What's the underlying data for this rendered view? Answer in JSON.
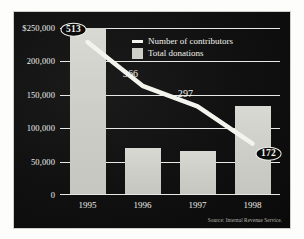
{
  "chart_data": {
    "type": "bar",
    "title": "",
    "subtitle": "",
    "xlabel": "",
    "ylabel": "",
    "categories": [
      "1995",
      "1996",
      "1997",
      "1998"
    ],
    "ylim": [
      0,
      250000
    ],
    "yticks": [
      0,
      50000,
      100000,
      150000,
      200000,
      250000
    ],
    "ytick_labels": [
      "0",
      "50,000",
      "100,000",
      "150,000",
      "200,000",
      "$250,000"
    ],
    "grid": true,
    "legend_position": "top-center",
    "series": [
      {
        "name": "Total donations",
        "type": "bar",
        "values": [
          250000,
          71000,
          66000,
          133000
        ],
        "color": "#cfcfc9",
        "axis": "left"
      },
      {
        "name": "Number of contributors",
        "type": "line",
        "values": [
          513,
          366,
          297,
          172
        ],
        "color": "#f4f4ef",
        "axis": "right",
        "point_labels": [
          "513",
          "366",
          "297",
          "172"
        ],
        "label_styles": [
          "oval",
          "plain",
          "plain",
          "oval"
        ]
      }
    ],
    "source": "Source: Internal Revenue Service."
  },
  "legend": {
    "items": [
      {
        "label": "Number of contributors",
        "key": "line"
      },
      {
        "label": "Total donations",
        "key": "swatch"
      }
    ]
  },
  "axis": {
    "y_labels": [
      "$250,000",
      "200,000",
      "150,000",
      "100,000",
      "50,000",
      "0"
    ],
    "x_labels": [
      "1995",
      "1996",
      "1997",
      "1998"
    ]
  },
  "annotations": {
    "p0": "513",
    "p1": "366",
    "p2": "297",
    "p3": "172"
  },
  "footer": {
    "source": "Source: Internal Revenue Service."
  },
  "colors": {
    "background": "#0d0d0d",
    "bar": "#cfcfc9",
    "line": "#f4f4ef",
    "grid": "#e8e8e4",
    "text": "#efefea"
  }
}
